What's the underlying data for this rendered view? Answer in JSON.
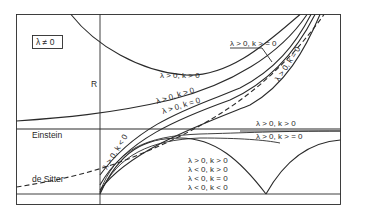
{
  "diagram": {
    "parameter_box": "λ ≠ 0",
    "axis_label": "R",
    "left_labels": {
      "einstein": "Einstein",
      "de_sitter": "de Sitter"
    },
    "curves": {
      "top_arc": "λ > 0, k > 0",
      "leader_label": "λ > 0, k > = 0",
      "diag_k_eq_0_right": "λ > 0, k = 0",
      "mid_k_gt_0": "λ > 0, k > 0",
      "mid_k_eq_0": "λ > 0, k = 0",
      "steep_k_lt_0": "λ > 0, k < 0",
      "einstein_above": "λ > 0, k > 0",
      "einstein_below": "λ > 0, k > = 0"
    },
    "oscillating_labels": [
      "λ > 0, k > 0",
      "λ < 0, k > 0",
      "λ < 0, k = 0",
      "λ < 0, k < 0"
    ],
    "colors": {
      "ink": "#2a2a2a",
      "background": "#ffffff"
    }
  }
}
